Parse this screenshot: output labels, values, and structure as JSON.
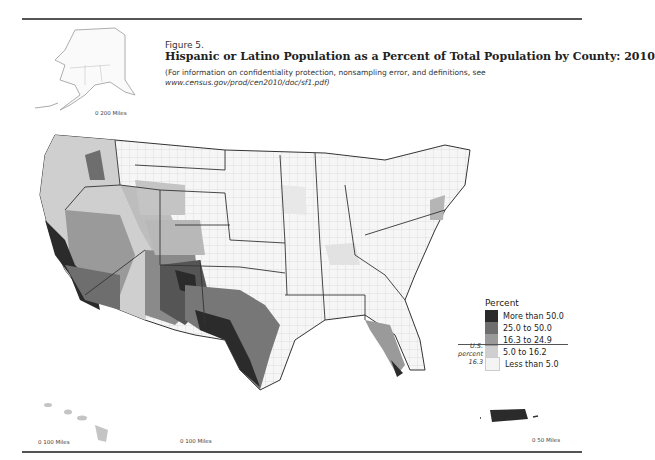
{
  "figure": {
    "label": "Figure 5.",
    "title": "Hispanic or Latino Population as a Percent of Total Population by County: 2010",
    "note_line1": "(For information on confidentiality protection, nonsampling error, and definitions, see",
    "note_url": "www.census.gov/prod/cen2010/doc/sf1.pdf)"
  },
  "scales": {
    "alaska": {
      "zero": "0",
      "label": "200 Miles"
    },
    "hawaii": {
      "zero": "0",
      "label": "100 Miles"
    },
    "conus": {
      "zero": "0",
      "label": "100 Miles"
    },
    "puerto_rico": {
      "zero": "0",
      "label": "50 Miles"
    }
  },
  "legend": {
    "title": "Percent",
    "items": [
      {
        "label": "More than 50.0",
        "color": "#2b2b2b"
      },
      {
        "label": "25.0 to 50.0",
        "color": "#6e6e6e"
      },
      {
        "label": "16.3 to 24.9",
        "color": "#9a9a9a"
      },
      {
        "label": "5.0 to 16.2",
        "color": "#cfcfcf"
      },
      {
        "label": "Less than 5.0",
        "color": "#f4f4f4"
      }
    ],
    "us_percent": {
      "line1": "U.S.",
      "line2": "percent",
      "value": "16.3"
    }
  }
}
